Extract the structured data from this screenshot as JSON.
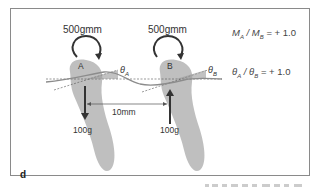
{
  "figure": {
    "panel_label": "d",
    "tooth_a": {
      "label": "A",
      "moment_label": "500gmm",
      "angle_symbol": "θ",
      "angle_subscript": "A",
      "force_label": "100g",
      "force_direction": "down"
    },
    "tooth_b": {
      "label": "B",
      "moment_label": "500gmm",
      "angle_symbol": "θ",
      "angle_subscript": "B",
      "force_label": "100g",
      "force_direction": "up"
    },
    "distance_label": "10mm",
    "equations": {
      "moment_ratio": {
        "lhs1": "M",
        "sub1": "A",
        "sep": " / ",
        "lhs2": "M",
        "sub2": "B",
        "rhs": " = + 1.0"
      },
      "angle_ratio": {
        "lhs1": "θ",
        "sub1": "A",
        "sep": " / ",
        "lhs2": "θ",
        "sub2": "B",
        "rhs": " = + 1.0"
      }
    },
    "colors": {
      "tooth_fill": "#b4b4b4",
      "wire": "#8c8c8c",
      "arrow": "#333333",
      "frame": "#8a8a8a"
    }
  }
}
